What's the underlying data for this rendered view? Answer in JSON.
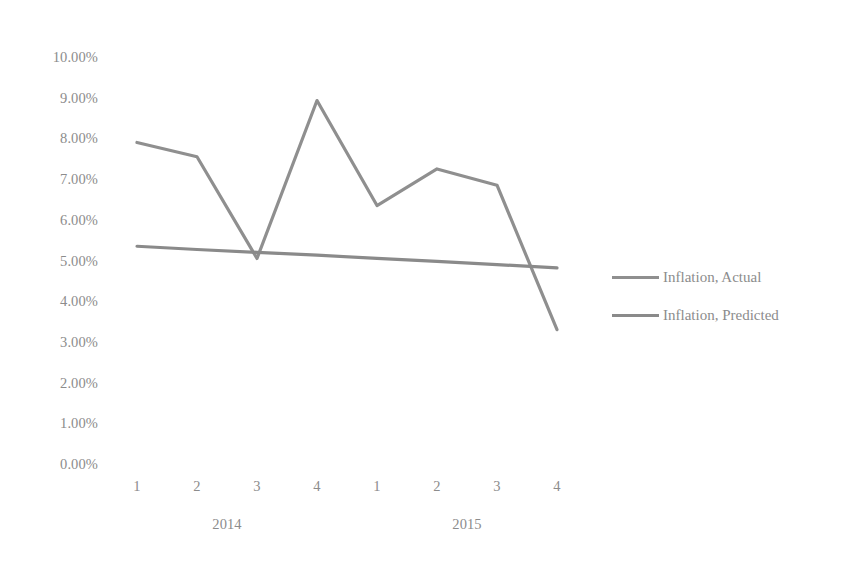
{
  "chart_data": {
    "type": "line",
    "title": "",
    "xlabel": "",
    "ylabel": "",
    "ylim": [
      0,
      10
    ],
    "ytick_format": "percent",
    "grid": false,
    "legend_position": "right",
    "categories": [
      "1",
      "2",
      "3",
      "4",
      "1",
      "2",
      "3",
      "4"
    ],
    "group_labels": [
      "2014",
      "2015"
    ],
    "ytick_labels": [
      "10.00%",
      "9.00%",
      "8.00%",
      "7.00%",
      "6.00%",
      "5.00%",
      "4.00%",
      "3.00%",
      "2.00%",
      "1.00%",
      "0.00%"
    ],
    "ytick_values": [
      10,
      9,
      8,
      7,
      6,
      5,
      4,
      3,
      2,
      1,
      0
    ],
    "series": [
      {
        "name": "Inflation, Actual",
        "color": "#8f8f8f",
        "values": [
          7.9,
          7.55,
          5.05,
          8.93,
          6.35,
          7.25,
          6.85,
          3.3
        ]
      },
      {
        "name": "Inflation, Predicted",
        "color": "#8a8a8a",
        "values": [
          5.35,
          5.27,
          5.2,
          5.13,
          5.05,
          4.98,
          4.9,
          4.82
        ]
      }
    ]
  },
  "legend": {
    "items": [
      {
        "label": "Inflation, Actual",
        "color": "#8f8f8f"
      },
      {
        "label": "Inflation, Predicted",
        "color": "#8a8a8a"
      }
    ]
  },
  "axes": {
    "y_labels": [
      "10.00%",
      "9.00%",
      "8.00%",
      "7.00%",
      "6.00%",
      "5.00%",
      "4.00%",
      "3.00%",
      "2.00%",
      "1.00%",
      "0.00%"
    ],
    "x_labels": [
      "1",
      "2",
      "3",
      "4",
      "1",
      "2",
      "3",
      "4"
    ],
    "x_groups": [
      "2014",
      "2015"
    ]
  }
}
